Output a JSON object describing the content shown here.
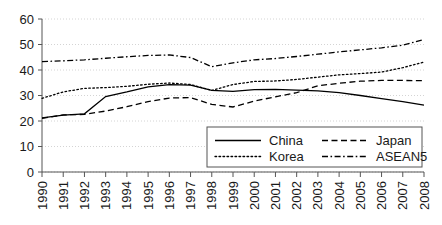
{
  "chart_data": {
    "type": "line",
    "title": "",
    "xlabel": "",
    "ylabel": "",
    "grid": true,
    "legend_position": "bottom-right",
    "ylim": [
      0,
      60
    ],
    "yticks": [
      0,
      10,
      20,
      30,
      40,
      50,
      60
    ],
    "categories": [
      "1990",
      "1991",
      "1992",
      "1993",
      "1994",
      "1995",
      "1996",
      "1997",
      "1998",
      "1999",
      "2000",
      "2001",
      "2002",
      "2003",
      "2004",
      "2005",
      "2006",
      "2007",
      "2008"
    ],
    "series": [
      {
        "name": "China",
        "style": "solid",
        "values": [
          21.2,
          22.3,
          22.8,
          29.6,
          31.4,
          33.4,
          34.3,
          34.1,
          32.0,
          31.6,
          32.3,
          32.4,
          32.1,
          31.8,
          31.1,
          30.0,
          28.8,
          27.6,
          26.2
        ]
      },
      {
        "name": "Japan",
        "style": "dashed",
        "values": [
          21.0,
          22.4,
          22.6,
          23.9,
          25.6,
          27.6,
          29.0,
          29.2,
          26.5,
          25.5,
          27.8,
          29.5,
          31.1,
          33.8,
          34.8,
          35.6,
          35.9,
          35.9,
          35.8
        ]
      },
      {
        "name": "Korea",
        "style": "dotted",
        "values": [
          28.9,
          31.4,
          32.8,
          33.1,
          33.6,
          34.4,
          34.9,
          34.3,
          32.0,
          34.3,
          35.5,
          35.7,
          36.3,
          37.2,
          38.1,
          38.6,
          39.2,
          40.9,
          43.1
        ]
      },
      {
        "name": "ASEAN5",
        "style": "dashdot",
        "values": [
          43.3,
          43.6,
          44.0,
          44.6,
          45.2,
          45.7,
          45.9,
          44.9,
          41.3,
          42.8,
          44.0,
          44.5,
          45.3,
          46.2,
          47.1,
          47.9,
          48.7,
          49.7,
          52.0
        ]
      }
    ]
  },
  "axis": {
    "y_labels": [
      "60",
      "50",
      "40",
      "30",
      "20",
      "10",
      "0"
    ],
    "x_labels": [
      "1990",
      "1991",
      "1992",
      "1993",
      "1994",
      "1995",
      "1996",
      "1997",
      "1998",
      "1999",
      "2000",
      "2001",
      "2002",
      "2003",
      "2004",
      "2005",
      "2006",
      "2007",
      "2008"
    ]
  },
  "legend": {
    "entries": [
      {
        "label": "China",
        "style": "solid"
      },
      {
        "label": "Japan",
        "style": "dashed"
      },
      {
        "label": "Korea",
        "style": "dotted"
      },
      {
        "label": "ASEAN5",
        "style": "dashdot"
      }
    ]
  },
  "colors": {
    "line": "#000000",
    "grid": "#c9c9c9",
    "axis": "#555555",
    "text": "#1a1a1a",
    "background": "#ffffff"
  }
}
